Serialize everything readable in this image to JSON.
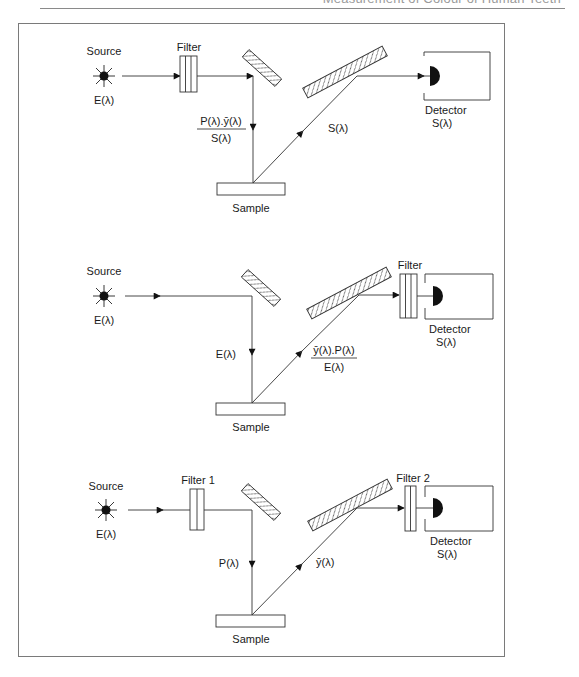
{
  "header": {
    "running_title": "Measurement of Colour of Human Teeth"
  },
  "diagrams": [
    {
      "id": "config-1",
      "source": {
        "label": "Source",
        "spectrum": "E(λ)"
      },
      "filter_before_sample": {
        "label": "Filter"
      },
      "incident_beam_label": {
        "numerator": "P(λ).ȳ(λ)",
        "denominator": "S(λ)"
      },
      "sample": {
        "label": "Sample"
      },
      "reflected_beam_label": "S(λ)",
      "filter_before_detector": null,
      "detector": {
        "label": "Detector",
        "response": "S(λ)"
      }
    },
    {
      "id": "config-2",
      "source": {
        "label": "Source",
        "spectrum": "E(λ)"
      },
      "filter_before_sample": null,
      "incident_beam_label": "E(λ)",
      "sample": {
        "label": "Sample"
      },
      "reflected_beam_label": {
        "numerator": "ȳ(λ).P(λ)",
        "denominator": "E(λ)"
      },
      "filter_before_detector": {
        "label": "Filter"
      },
      "detector": {
        "label": "Detector",
        "response": "S(λ)"
      }
    },
    {
      "id": "config-3",
      "source": {
        "label": "Source",
        "spectrum": "E(λ)"
      },
      "filter_before_sample": {
        "label": "Filter 1"
      },
      "incident_beam_label": "P(λ)",
      "sample": {
        "label": "Sample"
      },
      "reflected_beam_label": "ȳ(λ)",
      "filter_before_detector": {
        "label": "Filter 2"
      },
      "detector": {
        "label": "Detector",
        "response": "S(λ)"
      }
    }
  ],
  "colors": {
    "line": "#333333",
    "frame": "#7a7a7a",
    "header_text": "#9a9a9a",
    "background": "#ffffff"
  }
}
